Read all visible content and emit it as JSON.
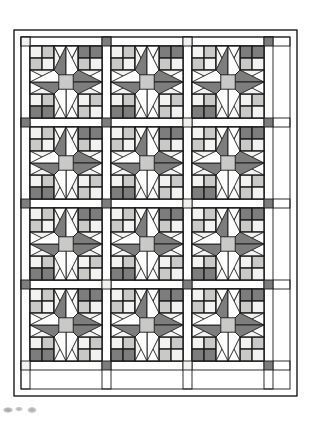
{
  "document": {
    "type": "quilt-pattern-diagram",
    "title": "Star Quilt Layout Diagram",
    "background_color": "#ffffff"
  },
  "palette": {
    "background": "#ffffff",
    "light": "#f2f2f0",
    "medium": "#c9c9c7",
    "dark": "#7d7d7d",
    "line": "#1a1a1a",
    "outer_border": "#ffffff"
  },
  "layout": {
    "canvas_width": 311,
    "canvas_height": 428,
    "quilt_left": 14,
    "quilt_top": 30,
    "quilt_width": 283,
    "quilt_height": 366,
    "border_width": 7,
    "sashing_width": 9,
    "block_size": 72,
    "columns": 3,
    "rows": 4,
    "stroke_width": 0.9
  },
  "block": {
    "name": "eight-pointed-star-block",
    "grid_units": 6,
    "description": "Eight pointed star with pieced four-patch and half-square-triangle corners",
    "center_color": "medium",
    "star_point_color": "dark",
    "background_color": "light"
  },
  "sashing": {
    "strip_color": "#ffffff",
    "corner_squares": [
      {
        "row": 0,
        "col": 0,
        "color": "light"
      },
      {
        "row": 0,
        "col": 1,
        "color": "dark"
      },
      {
        "row": 0,
        "col": 2,
        "color": "light"
      },
      {
        "row": 0,
        "col": 3,
        "color": "dark"
      },
      {
        "row": 1,
        "col": 0,
        "color": "dark"
      },
      {
        "row": 1,
        "col": 1,
        "color": "dark"
      },
      {
        "row": 1,
        "col": 2,
        "color": "light"
      },
      {
        "row": 1,
        "col": 3,
        "color": "dark"
      },
      {
        "row": 2,
        "col": 0,
        "color": "dark"
      },
      {
        "row": 2,
        "col": 1,
        "color": "dark"
      },
      {
        "row": 2,
        "col": 2,
        "color": "light"
      },
      {
        "row": 2,
        "col": 3,
        "color": "dark"
      },
      {
        "row": 3,
        "col": 0,
        "color": "dark"
      },
      {
        "row": 3,
        "col": 1,
        "color": "light"
      },
      {
        "row": 3,
        "col": 2,
        "color": "dark"
      },
      {
        "row": 3,
        "col": 3,
        "color": "dark"
      },
      {
        "row": 4,
        "col": 0,
        "color": "light"
      },
      {
        "row": 4,
        "col": 1,
        "color": "dark"
      },
      {
        "row": 4,
        "col": 2,
        "color": "light"
      },
      {
        "row": 4,
        "col": 3,
        "color": "dark"
      }
    ]
  },
  "blocks_grid": [
    [
      "star-block",
      "star-block",
      "star-block"
    ],
    [
      "star-block",
      "star-block",
      "star-block"
    ],
    [
      "star-block",
      "star-block",
      "star-block"
    ],
    [
      "star-block",
      "star-block",
      "star-block"
    ]
  ]
}
